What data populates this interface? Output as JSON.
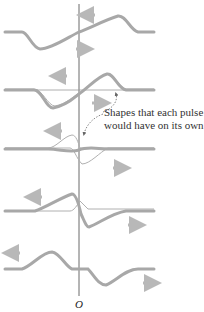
{
  "diagram": {
    "annotation": {
      "line1": "Shapes that each pulse",
      "line2": "would have on its own"
    },
    "origin_label": "O",
    "colors": {
      "wave": "#a8a8a8",
      "thin_wave": "#b0b0b0",
      "axis": "#444444",
      "arrow": "#b8b8b8",
      "dashed": "#666666"
    },
    "frames": [
      {
        "index": 1,
        "description": "pulses approaching overlap; left-moving arrow above, right-moving arrow below"
      },
      {
        "index": 2,
        "description": "partial overlap; resultant plus individual shapes"
      },
      {
        "index": 3,
        "description": "complete overlap; pulses cancel to nearly flat"
      },
      {
        "index": 4,
        "description": "separating after overlap"
      },
      {
        "index": 5,
        "description": "pulses fully separated, moving apart"
      }
    ]
  }
}
